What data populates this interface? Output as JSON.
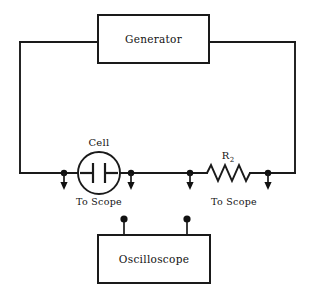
{
  "figure": {
    "kind": "electrical-circuit-schematic",
    "background_color": "#ffffff",
    "line_color": "#1a1a1a",
    "width": 311,
    "height": 297
  },
  "boxes": {
    "generator": {
      "label": "Generator",
      "x": 98,
      "y": 15,
      "width": 111,
      "height": 48
    },
    "oscilloscope": {
      "label": "Oscilloscope",
      "x": 98,
      "y": 235,
      "width": 112,
      "height": 48
    }
  },
  "components": {
    "cell": {
      "label": "Cell",
      "center_x": 99,
      "center_y": 173,
      "radius": 21
    },
    "resistor": {
      "label_main": "R",
      "label_sub": "2",
      "x_start": 207,
      "x_end": 250,
      "y": 173
    }
  },
  "annotations": {
    "to_scope_left": "To Scope",
    "to_scope_right": "To Scope"
  },
  "taps": [
    {
      "name": "tap-left-of-cell",
      "x": 64,
      "y": 173
    },
    {
      "name": "tap-right-of-cell",
      "x": 131,
      "y": 173
    },
    {
      "name": "tap-left-of-resistor",
      "x": 190,
      "y": 173
    },
    {
      "name": "tap-right-of-resistor",
      "x": 268,
      "y": 173
    }
  ],
  "scope_terminals": [
    {
      "name": "scope-terminal-left",
      "x": 124,
      "y": 219
    },
    {
      "name": "scope-terminal-right",
      "x": 187,
      "y": 219
    }
  ],
  "loop": {
    "left_wire_x": 20,
    "right_wire_x": 295,
    "top_wire_y": 42,
    "bottom_wire_y": 173
  }
}
